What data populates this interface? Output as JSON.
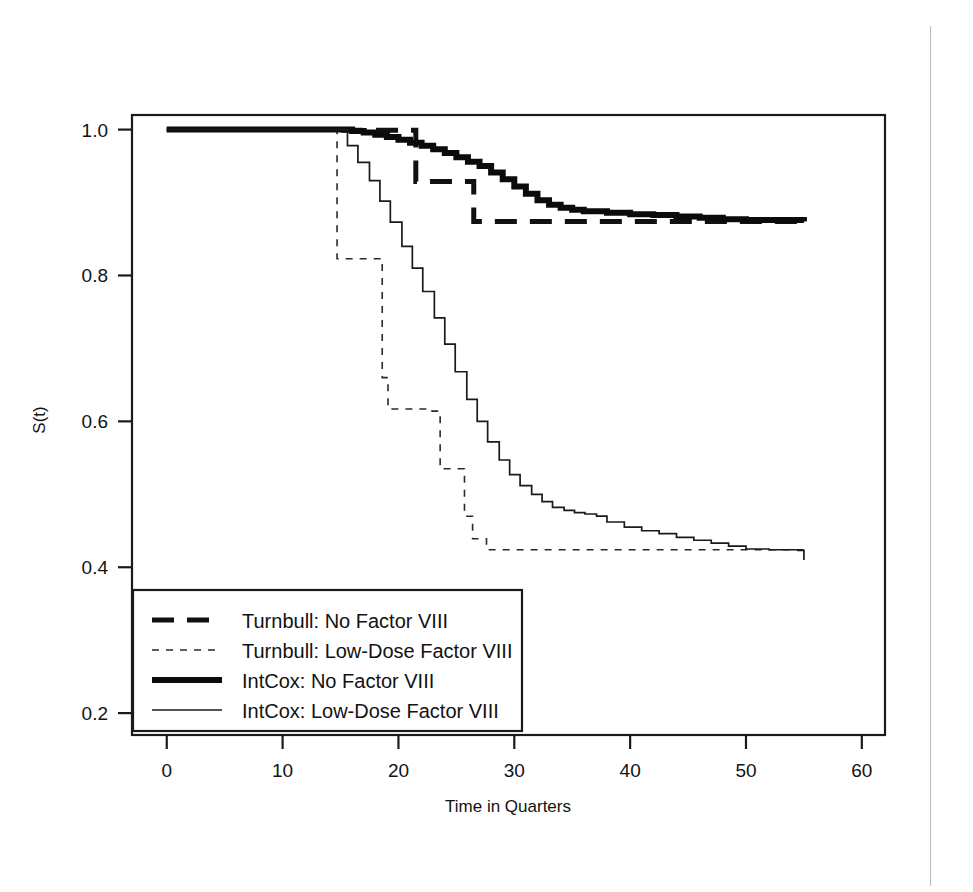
{
  "chart_data": {
    "type": "line",
    "title": "",
    "xlabel": "Time in Quarters",
    "ylabel": "S(t)",
    "xlim": [
      -3,
      62
    ],
    "ylim": [
      0.17,
      1.02
    ],
    "xticks": [
      0,
      10,
      20,
      30,
      40,
      50,
      60
    ],
    "xtick_labels": [
      "0",
      "10",
      "20",
      "30",
      "40",
      "50",
      "60"
    ],
    "yticks": [
      0.2,
      0.4,
      0.6,
      0.8,
      1.0
    ],
    "ytick_labels": [
      "0.2",
      "0.4",
      "0.6",
      "0.8",
      "1.0"
    ],
    "grid": false,
    "legend_position": "lower left",
    "series": [
      {
        "name": "Turnbull: No Factor VIII",
        "style": "dashed",
        "linewidth": 5,
        "color": "#111111",
        "x": [
          0,
          14,
          14,
          21.5,
          21.5,
          26.5,
          26.5,
          55
        ],
        "y": [
          1.0,
          1.0,
          0.999,
          0.999,
          0.929,
          0.929,
          0.874,
          0.874
        ]
      },
      {
        "name": "Turnbull: Low-Dose Factor VIII",
        "style": "dotted",
        "linewidth": 1.6,
        "color": "#2a2a2a",
        "x": [
          0,
          14.7,
          14.7,
          18.6,
          18.6,
          19.1,
          19.1,
          22.5,
          22.5,
          23.6,
          23.6,
          25.7,
          25.7,
          26.4,
          26.4,
          27.6,
          27.6,
          55
        ],
        "y": [
          1.0,
          1.0,
          0.823,
          0.823,
          0.66,
          0.66,
          0.617,
          0.617,
          0.614,
          0.614,
          0.535,
          0.535,
          0.47,
          0.47,
          0.439,
          0.439,
          0.424,
          0.424
        ]
      },
      {
        "name": "IntCox: No Factor VIII",
        "style": "solid-thick",
        "linewidth": 6,
        "color": "#0b0b0b",
        "x": [
          0,
          15,
          16,
          17,
          18,
          19,
          20,
          21,
          22,
          23,
          24,
          25,
          26,
          27,
          28,
          29,
          30,
          31,
          32,
          33,
          34,
          35,
          36,
          38,
          40,
          42,
          44,
          46,
          48,
          50,
          55
        ],
        "y": [
          1.0,
          1.0,
          0.998,
          0.996,
          0.993,
          0.99,
          0.986,
          0.982,
          0.978,
          0.973,
          0.968,
          0.962,
          0.956,
          0.95,
          0.941,
          0.932,
          0.922,
          0.912,
          0.903,
          0.897,
          0.893,
          0.89,
          0.888,
          0.886,
          0.884,
          0.883,
          0.881,
          0.879,
          0.877,
          0.876,
          0.874
        ]
      },
      {
        "name": "IntCox: Low-Dose Factor VIII",
        "style": "solid-thin",
        "linewidth": 1.7,
        "color": "#1a1a1a",
        "x": [
          0,
          14.7,
          15.6,
          16.5,
          17.5,
          18.4,
          19.3,
          20.3,
          21.2,
          22.1,
          23.1,
          24.0,
          24.9,
          25.9,
          26.8,
          27.7,
          28.7,
          29.6,
          30.5,
          31.5,
          32.4,
          33.3,
          34.3,
          35.2,
          36.1,
          37.1,
          38.0,
          39.5,
          41.0,
          42.5,
          44.0,
          45.5,
          47.0,
          48.5,
          50.0,
          52.0,
          54.5,
          55.0
        ],
        "y": [
          1.0,
          1.0,
          0.978,
          0.955,
          0.93,
          0.902,
          0.873,
          0.84,
          0.81,
          0.778,
          0.742,
          0.706,
          0.668,
          0.63,
          0.6,
          0.572,
          0.547,
          0.527,
          0.512,
          0.5,
          0.49,
          0.482,
          0.478,
          0.475,
          0.473,
          0.47,
          0.462,
          0.455,
          0.45,
          0.446,
          0.441,
          0.437,
          0.433,
          0.429,
          0.425,
          0.424,
          0.423,
          0.41
        ]
      }
    ]
  },
  "legend": {
    "entries": [
      {
        "label": "Turnbull: No Factor VIII",
        "key": "turnbull-no-factor-viii"
      },
      {
        "label": "Turnbull: Low-Dose Factor VIII",
        "key": "turnbull-low-dose-factor-viii"
      },
      {
        "label": "IntCox: No Factor VIII",
        "key": "intcox-no-factor-viii"
      },
      {
        "label": "IntCox: Low-Dose Factor VIII",
        "key": "intcox-low-dose-factor-viii"
      }
    ]
  }
}
